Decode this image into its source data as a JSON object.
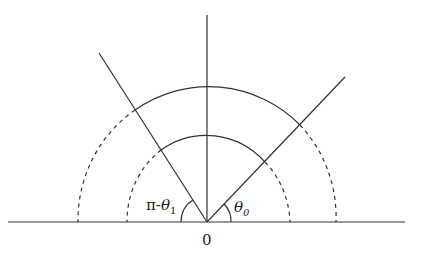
{
  "diagram": {
    "type": "angle-geometry",
    "origin_label": "0",
    "angle_right_label": {
      "symbol": "θ",
      "subscript": "0"
    },
    "angle_left_label": {
      "prefix": "π-",
      "symbol": "θ",
      "subscript": "1"
    },
    "elements": [
      "horizontal-baseline",
      "vertical-axis",
      "right-ray",
      "left-ray",
      "outer-arc-solid",
      "inner-arc-solid",
      "outer-arc-dashed-left",
      "outer-arc-dashed-right",
      "inner-arc-dashed-left",
      "inner-arc-dashed-right",
      "angle-arc-right",
      "angle-arc-left"
    ],
    "colors": {
      "stroke": "#333333",
      "background": "#ffffff"
    }
  }
}
